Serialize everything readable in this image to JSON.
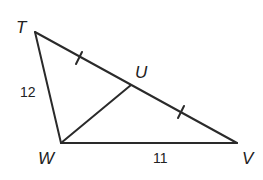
{
  "diagram": {
    "type": "geometry-triangle",
    "stroke_color": "#2a2a2a",
    "vertices": {
      "T": {
        "label": "T",
        "x": 35,
        "y": 32
      },
      "U": {
        "label": "U",
        "x": 131,
        "y": 85
      },
      "V": {
        "label": "V",
        "x": 237,
        "y": 143
      },
      "W": {
        "label": "W",
        "x": 61,
        "y": 143
      }
    },
    "segments": [
      {
        "from": "T",
        "to": "V"
      },
      {
        "from": "T",
        "to": "W"
      },
      {
        "from": "W",
        "to": "V"
      },
      {
        "from": "W",
        "to": "U"
      }
    ],
    "measures": {
      "TW": "12",
      "WV": "11"
    },
    "congruence_marks": [
      "TU",
      "UV"
    ]
  }
}
